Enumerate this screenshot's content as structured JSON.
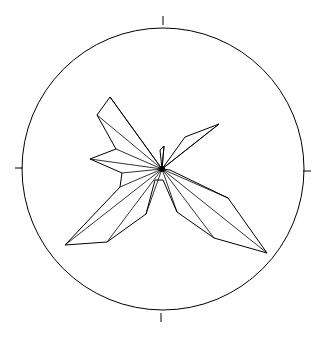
{
  "chart_data": {
    "type": "rose",
    "title": "",
    "center": [
      162,
      169
    ],
    "radius": 145,
    "ticks": [
      "N",
      "E",
      "S",
      "W"
    ],
    "grid": false,
    "line_color": "#000000",
    "background": "#ffffff",
    "petals": [
      {
        "azimuth_deg": 5,
        "relative_length": 0.16
      },
      {
        "azimuth_deg": 35,
        "relative_length": 0.28
      },
      {
        "azimuth_deg": 60,
        "relative_length": 0.5
      },
      {
        "azimuth_deg": 100,
        "relative_length": 0.05
      },
      {
        "azimuth_deg": 115,
        "relative_length": 0.47
      },
      {
        "azimuth_deg": 130,
        "relative_length": 0.78
      },
      {
        "azimuth_deg": 140,
        "relative_length": 0.61
      },
      {
        "azimuth_deg": 155,
        "relative_length": 0.33
      },
      {
        "azimuth_deg": 180,
        "relative_length": 0.08
      },
      {
        "azimuth_deg": 200,
        "relative_length": 0.33
      },
      {
        "azimuth_deg": 225,
        "relative_length": 0.67
      },
      {
        "azimuth_deg": 235,
        "relative_length": 0.78
      },
      {
        "azimuth_deg": 260,
        "relative_length": 0.3
      },
      {
        "azimuth_deg": 265,
        "relative_length": 0.28
      },
      {
        "azimuth_deg": 290,
        "relative_length": 0.5
      },
      {
        "azimuth_deg": 300,
        "relative_length": 0.36
      },
      {
        "azimuth_deg": 325,
        "relative_length": 0.53
      },
      {
        "azimuth_deg": 335,
        "relative_length": 0.52
      }
    ],
    "outline_points": [
      [
        162,
        169
      ],
      [
        164,
        146
      ],
      [
        160,
        150
      ],
      [
        162,
        169
      ],
      [
        185,
        137
      ],
      [
        219,
        124
      ],
      [
        162,
        169
      ],
      [
        170,
        170
      ],
      [
        228,
        198
      ],
      [
        267,
        253
      ],
      [
        214,
        238
      ],
      [
        177,
        212
      ],
      [
        163,
        180
      ],
      [
        155,
        180
      ],
      [
        146,
        214
      ],
      [
        107,
        242
      ],
      [
        65,
        245
      ],
      [
        120,
        187
      ],
      [
        122,
        173
      ],
      [
        90,
        159
      ],
      [
        116,
        149
      ],
      [
        97,
        115
      ],
      [
        110,
        97
      ],
      [
        162,
        169
      ]
    ],
    "spokes": [
      [
        [
          162,
          169
        ],
        [
          164,
          146
        ]
      ],
      [
        [
          162,
          169
        ],
        [
          219,
          124
        ]
      ],
      [
        [
          162,
          169
        ],
        [
          228,
          198
        ]
      ],
      [
        [
          162,
          169
        ],
        [
          267,
          253
        ]
      ],
      [
        [
          162,
          169
        ],
        [
          214,
          238
        ]
      ],
      [
        [
          162,
          169
        ],
        [
          177,
          212
        ]
      ],
      [
        [
          162,
          169
        ],
        [
          146,
          214
        ]
      ],
      [
        [
          162,
          169
        ],
        [
          107,
          242
        ]
      ],
      [
        [
          162,
          169
        ],
        [
          65,
          245
        ]
      ],
      [
        [
          162,
          169
        ],
        [
          120,
          187
        ]
      ],
      [
        [
          162,
          169
        ],
        [
          122,
          173
        ]
      ],
      [
        [
          162,
          169
        ],
        [
          90,
          159
        ]
      ],
      [
        [
          162,
          169
        ],
        [
          116,
          149
        ]
      ],
      [
        [
          162,
          169
        ],
        [
          97,
          115
        ]
      ],
      [
        [
          162,
          169
        ],
        [
          110,
          97
        ]
      ]
    ]
  }
}
